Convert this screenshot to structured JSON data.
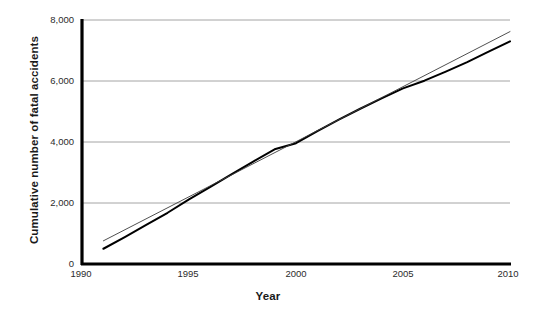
{
  "chart_data": {
    "type": "line",
    "title": "",
    "xlabel": "Year",
    "ylabel": "Cumulative number of fatal accidents",
    "xlim": [
      1990,
      2010
    ],
    "ylim": [
      0,
      8000
    ],
    "xticks": [
      "1990",
      "1995",
      "2000",
      "2005",
      "2010"
    ],
    "xtick_values": [
      1990,
      1995,
      2000,
      2005,
      2010
    ],
    "yticks": [
      "0",
      "2,000",
      "4,000",
      "6,000",
      "8,000"
    ],
    "ytick_values": [
      0,
      2000,
      4000,
      6000,
      8000
    ],
    "grid": "horizontal",
    "grid_color": "#9a9a9a",
    "legend": "none",
    "axis_color": "#000000",
    "series": [
      {
        "name": "Cumulative fatal accidents",
        "color": "#000000",
        "width": 2.0,
        "x": [
          1991,
          1992,
          1993,
          1994,
          1995,
          1996,
          1997,
          1998,
          1999,
          2000,
          2001,
          2002,
          2003,
          2004,
          2005,
          2006,
          2007,
          2008,
          2009,
          2010
        ],
        "values": [
          500,
          880,
          1280,
          1680,
          2120,
          2530,
          2950,
          3360,
          3760,
          3960,
          4360,
          4730,
          5090,
          5430,
          5760,
          6010,
          6310,
          6620,
          6960,
          7300
        ]
      },
      {
        "name": "Linear trend",
        "color": "#3c3c3c",
        "width": 0.9,
        "x": [
          1991,
          2010
        ],
        "values": [
          760,
          7620
        ]
      }
    ]
  }
}
